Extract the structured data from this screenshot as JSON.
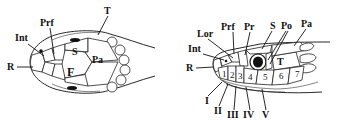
{
  "figure": {
    "dorsal_view": {
      "labels": {
        "T": "T",
        "Prf": "Prf",
        "Int": "Int",
        "S": "S",
        "Pa": "Pa",
        "R": "R",
        "F": "F"
      }
    },
    "lateral_view": {
      "labels": {
        "Prf": "Prf",
        "Pr": "Pr",
        "S": "S",
        "Po": "Po",
        "Pa": "Pa",
        "Lor": "Lor",
        "Int": "Int",
        "R": "R",
        "T": "T"
      },
      "supralabials": [
        "1",
        "2",
        "3",
        "4",
        "5",
        "6",
        "7"
      ],
      "infralabials": [
        "I",
        "II",
        "III",
        "IV",
        "V"
      ]
    }
  }
}
